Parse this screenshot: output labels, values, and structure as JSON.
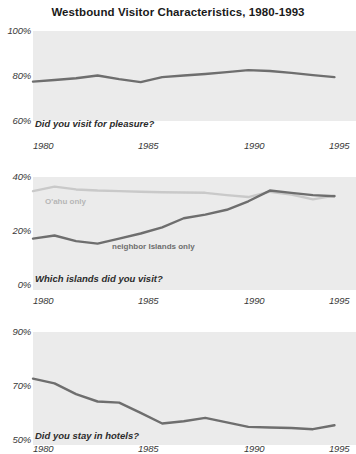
{
  "figure": {
    "title": "Westbound Visitor Characteristics, 1980-1993",
    "background": "#ffffff",
    "plot_background": "#ebebeb"
  },
  "colors": {
    "dark_line": "#6e6e6e",
    "light_line": "#c9c9c9",
    "tick_text": "#3a3a3a",
    "caption_text": "#2b2b2b",
    "title_text": "#1a1a1a"
  },
  "panels": [
    {
      "id": "pleasure",
      "caption": "Did you visit for pleasure?",
      "yticks": [
        "100%",
        "80%",
        "60%"
      ],
      "xticks": [
        "1980",
        "1985",
        "1990",
        "1995"
      ]
    },
    {
      "id": "islands",
      "caption": "Which islands did you visit?",
      "yticks": [
        "40%",
        "20%",
        "0%"
      ],
      "xticks": [
        "1980",
        "1985",
        "1990",
        "1995"
      ],
      "labels": {
        "oahu": "O'ahu only",
        "neighbor": "neighbor Islands only"
      }
    },
    {
      "id": "hotels",
      "caption": "Did you stay in hotels?",
      "yticks": [
        "90%",
        "70%",
        "50%"
      ],
      "xticks": [
        "1980",
        "1985",
        "1990",
        "1995"
      ]
    }
  ],
  "chart_data": [
    {
      "type": "line",
      "id": "pleasure",
      "title": "Did you visit for pleasure?",
      "xlabel": "",
      "ylabel": "",
      "xlim": [
        1980,
        1995
      ],
      "ylim": [
        60,
        100
      ],
      "yticks": [
        60,
        80,
        100
      ],
      "ytick_labels": [
        "60%",
        "80%",
        "100%"
      ],
      "xticks": [
        1980,
        1985,
        1990,
        1995
      ],
      "xtick_labels": [
        "1980",
        "1985",
        "1990",
        "1995"
      ],
      "grid": false,
      "legend": "none",
      "series": [
        {
          "name": "Visited for pleasure",
          "color": "#6e6e6e",
          "x": [
            1980,
            1981,
            1982,
            1983,
            1984,
            1985,
            1986,
            1987,
            1988,
            1989,
            1990,
            1991,
            1992,
            1993,
            1994
          ],
          "values": [
            77.5,
            78.2,
            79.0,
            80.2,
            78.6,
            77.3,
            79.5,
            80.2,
            80.9,
            81.7,
            82.6,
            82.2,
            81.4,
            80.4,
            79.5
          ]
        }
      ]
    },
    {
      "type": "line",
      "id": "islands",
      "title": "Which islands did you visit?",
      "xlabel": "",
      "ylabel": "",
      "xlim": [
        1980,
        1995
      ],
      "ylim": [
        0,
        40
      ],
      "yticks": [
        0,
        20,
        40
      ],
      "ytick_labels": [
        "0%",
        "20%",
        "40%"
      ],
      "xticks": [
        1980,
        1985,
        1990,
        1995
      ],
      "xtick_labels": [
        "1980",
        "1985",
        "1990",
        "1995"
      ],
      "grid": false,
      "legend": "inline-annotations",
      "annotations": [
        {
          "text": "O'ahu only",
          "x": 1981.0,
          "y": 32.2,
          "color": "#b6b6b6"
        },
        {
          "text": "neighbor Islands only",
          "x": 1984.3,
          "y": 15.8,
          "color": "#6e6e6e"
        }
      ],
      "series": [
        {
          "name": "O'ahu only",
          "color": "#c9c9c9",
          "x": [
            1980,
            1981,
            1982,
            1983,
            1984,
            1985,
            1986,
            1987,
            1988,
            1989,
            1990,
            1991,
            1992,
            1993,
            1994
          ],
          "values": [
            35.0,
            36.6,
            35.6,
            35.2,
            35.0,
            34.8,
            34.6,
            34.5,
            34.4,
            33.6,
            32.9,
            34.8,
            33.8,
            32.1,
            33.4
          ]
        },
        {
          "name": "neighbor Islands only",
          "color": "#6e6e6e",
          "x": [
            1980,
            1981,
            1982,
            1983,
            1984,
            1985,
            1986,
            1987,
            1988,
            1989,
            1990,
            1991,
            1992,
            1993,
            1994
          ],
          "values": [
            18.2,
            19.3,
            17.3,
            16.4,
            18.2,
            20.0,
            22.2,
            25.4,
            26.7,
            28.4,
            31.4,
            35.2,
            34.4,
            33.6,
            33.2
          ]
        }
      ]
    },
    {
      "type": "line",
      "id": "hotels",
      "title": "Did you stay in hotels?",
      "xlabel": "",
      "ylabel": "",
      "xlim": [
        1980,
        1995
      ],
      "ylim": [
        50,
        90
      ],
      "yticks": [
        50,
        70,
        90
      ],
      "ytick_labels": [
        "50%",
        "70%",
        "90%"
      ],
      "xticks": [
        1980,
        1985,
        1990,
        1995
      ],
      "xtick_labels": [
        "1980",
        "1985",
        "1990",
        "1995"
      ],
      "grid": false,
      "legend": "none",
      "series": [
        {
          "name": "Stayed in hotels",
          "color": "#6e6e6e",
          "x": [
            1980,
            1981,
            1982,
            1983,
            1984,
            1985,
            1986,
            1987,
            1988,
            1989,
            1990,
            1991,
            1992,
            1993,
            1994
          ],
          "values": [
            73.5,
            71.8,
            68.0,
            65.4,
            65.0,
            61.4,
            57.6,
            58.4,
            59.6,
            58.0,
            56.4,
            56.2,
            56.0,
            55.6,
            57.0
          ]
        }
      ]
    }
  ]
}
